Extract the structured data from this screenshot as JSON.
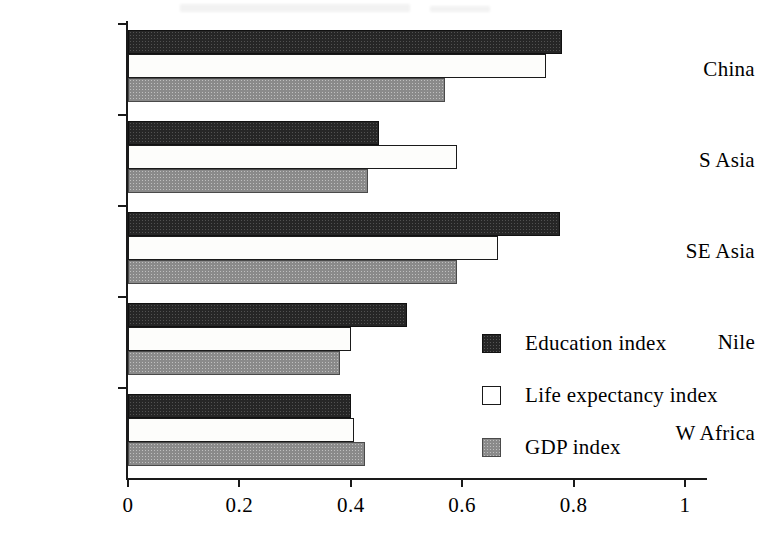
{
  "chart_data": {
    "type": "bar",
    "orientation": "horizontal",
    "title": "",
    "subtitle": "",
    "xlabel": "",
    "ylabel": "",
    "categories": [
      "China",
      "S Asia",
      "SE Asia",
      "Nile",
      "W Africa"
    ],
    "series": [
      {
        "name": "Education index",
        "color": "#262626",
        "fill": "dark-speckled",
        "values": [
          0.78,
          0.45,
          0.775,
          0.5,
          0.4
        ]
      },
      {
        "name": "Life expectancy index",
        "color": "#ffffff",
        "fill": "white-outline",
        "values": [
          0.75,
          0.59,
          0.665,
          0.4,
          0.405
        ]
      },
      {
        "name": "GDP index",
        "color": "#8a8a8a",
        "fill": "gray-speckled",
        "values": [
          0.57,
          0.43,
          0.59,
          0.38,
          0.425
        ]
      }
    ],
    "xlim": [
      0,
      1
    ],
    "xticks": [
      0,
      0.2,
      0.4,
      0.6,
      0.8,
      1
    ],
    "xticklabels": [
      "0",
      "0.2",
      "0.4",
      "0.6",
      "0.8",
      "1"
    ],
    "grid": false,
    "legend": {
      "position": "inside-right-lower",
      "entries": [
        "Education index",
        "Life expectancy index",
        "GDP index"
      ]
    }
  },
  "legend": {
    "entries": [
      {
        "label": "Education index",
        "swatch": "dark-speckled-swatch"
      },
      {
        "label": "Life expectancy index",
        "swatch": "white-outline-swatch"
      },
      {
        "label": "GDP index",
        "swatch": "gray-speckled-swatch"
      }
    ]
  },
  "axes": {
    "x_ticklabels": [
      "0",
      "0.2",
      "0.4",
      "0.6",
      "0.8",
      "1"
    ],
    "y_categories": [
      "China",
      "S Asia",
      "SE Asia",
      "Nile",
      "W Africa"
    ]
  }
}
